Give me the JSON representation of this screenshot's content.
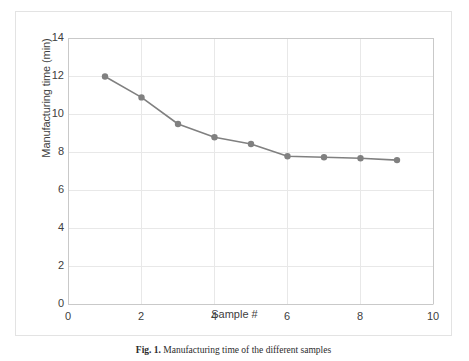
{
  "figure": {
    "caption_label": "Fig. 1.",
    "caption_text": "Manufacturing time of the different samples"
  },
  "chart_data": {
    "type": "line",
    "title": "",
    "xlabel": "Sample #",
    "ylabel": "Manufacturing time (min)",
    "x": [
      1,
      2,
      3,
      4,
      5,
      6,
      7,
      8,
      9
    ],
    "values": [
      12.0,
      10.9,
      9.5,
      8.8,
      8.45,
      7.8,
      7.75,
      7.7,
      7.6
    ],
    "series": [
      {
        "name": "Manufacturing time",
        "values": [
          12.0,
          10.9,
          9.5,
          8.8,
          8.45,
          7.8,
          7.75,
          7.7,
          7.6
        ]
      }
    ],
    "xlim": [
      0,
      10
    ],
    "ylim": [
      0,
      14
    ],
    "xticks": [
      0,
      2,
      4,
      6,
      8,
      10
    ],
    "yticks": [
      0,
      2,
      4,
      6,
      8,
      10,
      12,
      14
    ],
    "xtick_labels": [
      "0",
      "2",
      "4",
      "6",
      "8",
      "10"
    ],
    "ytick_labels": [
      "0",
      "2",
      "4",
      "6",
      "8",
      "10",
      "12",
      "14"
    ],
    "grid": true,
    "grid_axis": "both",
    "legend": false,
    "legend_position": "none",
    "marker": "circle",
    "colors": {
      "line": "#808080",
      "marker": "#808080",
      "grid": "#e8e8e8",
      "axis": "#c9c9c9",
      "text": "#404040",
      "frame": "#e3e3e3",
      "background": "#ffffff"
    }
  }
}
